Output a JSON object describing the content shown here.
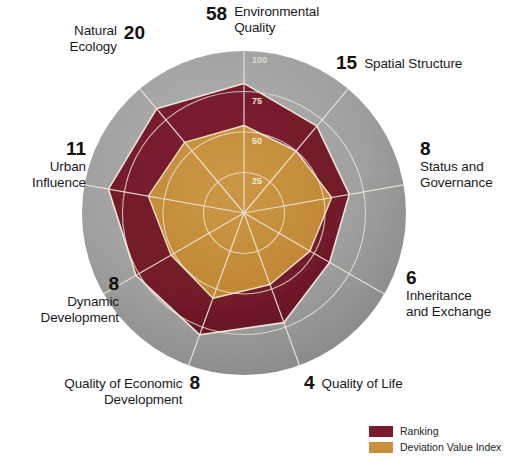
{
  "chart_data": {
    "type": "radar",
    "title": "",
    "categories": [
      "Environmental Quality",
      "Spatial Structure",
      "Status and Governance",
      "Inheritance and Exchange",
      "Quality of Life",
      "Quality of Economic Development",
      "Dynamic Development",
      "Urban Influence",
      "Natural Ecology"
    ],
    "radial_ticks": [
      "100",
      "75",
      "50",
      "25"
    ],
    "radial_range": [
      0,
      100
    ],
    "grid": true,
    "legend_position": "bottom-right",
    "series": [
      {
        "name": "Ranking",
        "color": "#7a1b2c",
        "values": [
          80,
          70,
          66,
          61,
          72,
          80,
          77,
          85,
          84
        ]
      },
      {
        "name": "Deviation Value Index",
        "color": "#c9913f",
        "values": [
          54,
          50,
          55,
          47,
          47,
          56,
          52,
          60,
          57
        ]
      }
    ],
    "ranking_numbers": [
      58,
      15,
      8,
      6,
      4,
      8,
      8,
      11,
      20
    ],
    "background_ring_color": "#9b9b9b"
  },
  "axes": [
    {
      "id": "environmental-quality",
      "value": "58",
      "name_line1": "Environmental",
      "name_line2": "Quality"
    },
    {
      "id": "spatial-structure",
      "value": "15",
      "name_line1": "Spatial Structure",
      "name_line2": ""
    },
    {
      "id": "status-and-governance",
      "value": "8",
      "name_line1": "Status and",
      "name_line2": "Governance"
    },
    {
      "id": "inheritance-and-exchange",
      "value": "6",
      "name_line1": "Inheritance",
      "name_line2": "and Exchange"
    },
    {
      "id": "quality-of-life",
      "value": "4",
      "name_line1": "Quality of Life",
      "name_line2": ""
    },
    {
      "id": "quality-of-economic-development",
      "value": "8",
      "name_line1": "Quality of Economic",
      "name_line2": "Development"
    },
    {
      "id": "dynamic-development",
      "value": "8",
      "name_line1": "Dynamic",
      "name_line2": "Development"
    },
    {
      "id": "urban-influence",
      "value": "11",
      "name_line1": "Urban",
      "name_line2": "Influence"
    },
    {
      "id": "natural-ecology",
      "value": "20",
      "name_line1": "Natural",
      "name_line2": "Ecology"
    }
  ],
  "ticks": {
    "t100": "100",
    "t75": "75",
    "t50": "50",
    "t25": "25"
  },
  "legend": {
    "items": [
      {
        "label": "Ranking",
        "color": "#7a1b2c"
      },
      {
        "label": "Deviation Value Index",
        "color": "#c9913f"
      }
    ]
  },
  "colors": {
    "ranking": "#7a1b2c",
    "deviation": "#c9913f",
    "ring": "#9b9b9b",
    "grid": "#e8e2d6",
    "text": "#1a1a1a"
  }
}
